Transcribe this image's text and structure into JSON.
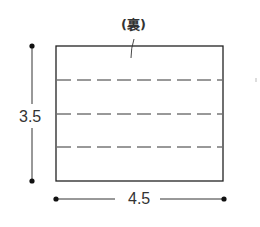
{
  "diagram": {
    "type": "paper-fold-diagram",
    "rectangle": {
      "x": 56,
      "y": 46,
      "width": 167,
      "height": 135,
      "stroke": "#222222"
    },
    "fold_lines": {
      "style": "dashed",
      "count": 3,
      "y_positions": [
        80,
        114,
        147
      ]
    },
    "labels": {
      "back_side": "(裏)",
      "height": "3.5",
      "width": "4.5"
    },
    "dimensions": {
      "height": {
        "value": "3.5",
        "orientation": "vertical",
        "x": 32,
        "y1": 46,
        "y2": 181
      },
      "width": {
        "value": "4.5",
        "orientation": "horizontal",
        "y": 199,
        "x1": 56,
        "x2": 224
      }
    }
  }
}
